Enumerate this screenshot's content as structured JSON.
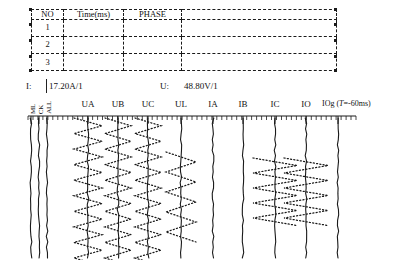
{
  "table": {
    "headers": [
      "NO",
      "Time(ms)",
      "PHASE",
      ""
    ],
    "rows": [
      {
        "no": "1",
        "time": "",
        "phase": "",
        "extra": ""
      },
      {
        "no": "2",
        "time": "",
        "phase": "",
        "extra": ""
      },
      {
        "no": "3",
        "time": "",
        "phase": "",
        "extra": ""
      }
    ]
  },
  "readout": {
    "current_label": "I:",
    "current_value": "17.20A/1",
    "voltage_label": "U:",
    "voltage_value": "48.80V/1"
  },
  "channels": {
    "vertical_labels": [
      "ML",
      "CK",
      "ALL"
    ],
    "labels": [
      "UA",
      "UB",
      "UC",
      "UL",
      "IA",
      "IB",
      "IC",
      "IO"
    ],
    "annotation": "IOg (T=-60ms)",
    "annotation_prefix": "IOg (",
    "annotation_italic": "T",
    "annotation_suffix": "=-60ms)"
  },
  "chart_data": {
    "type": "line",
    "title": "",
    "xlabel": "",
    "ylabel": "",
    "orientation": "vertical-traces",
    "axis": {
      "x_start": 28,
      "x_end": 356,
      "tick_minor_count": 66,
      "grid": false
    },
    "traces": [
      {
        "name": "ML",
        "x": 31,
        "style": "solid",
        "amplitude": 0,
        "type": "flat"
      },
      {
        "name": "CK",
        "x": 39,
        "style": "solid",
        "amplitude": 0,
        "type": "flat"
      },
      {
        "name": "ALL",
        "x": 47,
        "style": "solid",
        "amplitude": 0,
        "type": "flat"
      },
      {
        "name": "UA",
        "x": 88,
        "style": "solid",
        "amplitude": 0,
        "type": "flat"
      },
      {
        "name": "UA-osc",
        "x": 88,
        "style": "dotted",
        "amplitude": 14,
        "cycles": 9,
        "y_from": 118,
        "y_to": 258
      },
      {
        "name": "UB",
        "x": 118,
        "style": "solid",
        "amplitude": 0,
        "type": "flat"
      },
      {
        "name": "UB-osc",
        "x": 118,
        "style": "dotted",
        "amplitude": 13,
        "cycles": 9,
        "y_from": 118,
        "y_to": 258
      },
      {
        "name": "UC",
        "x": 148,
        "style": "solid",
        "amplitude": 0,
        "type": "flat"
      },
      {
        "name": "UC-osc",
        "x": 148,
        "style": "dotted",
        "amplitude": 13,
        "cycles": 9,
        "y_from": 118,
        "y_to": 258
      },
      {
        "name": "UL",
        "x": 181,
        "style": "solid",
        "amplitude": 0,
        "type": "flat"
      },
      {
        "name": "UL-osc",
        "x": 181,
        "style": "dotted",
        "amplitude": 15,
        "cycles": 4,
        "y_from": 152,
        "y_to": 232
      },
      {
        "name": "IA",
        "x": 213,
        "style": "solid",
        "amplitude": 0,
        "type": "flat"
      },
      {
        "name": "IB",
        "x": 243,
        "style": "solid",
        "amplitude": 0,
        "type": "flat"
      },
      {
        "name": "IC",
        "x": 275,
        "style": "solid",
        "amplitude": 0,
        "type": "flat"
      },
      {
        "name": "IC-osc",
        "x": 275,
        "style": "dotted",
        "amplitude": 22,
        "cycles": 4,
        "y_from": 158,
        "y_to": 218
      },
      {
        "name": "IO",
        "x": 306,
        "style": "solid",
        "amplitude": 0,
        "type": "flat"
      },
      {
        "name": "IO-osc",
        "x": 306,
        "style": "dotted",
        "amplitude": 22,
        "cycles": 4,
        "y_from": 158,
        "y_to": 218
      },
      {
        "name": "IOg",
        "x": 338,
        "style": "solid",
        "amplitude": 0,
        "type": "flat"
      }
    ],
    "label_positions": [
      88,
      118,
      148,
      181,
      213,
      243,
      275,
      306
    ],
    "colors": {
      "trace": "#1a1a1a",
      "axis": "#1a1a1a",
      "background": "#ffffff"
    }
  }
}
